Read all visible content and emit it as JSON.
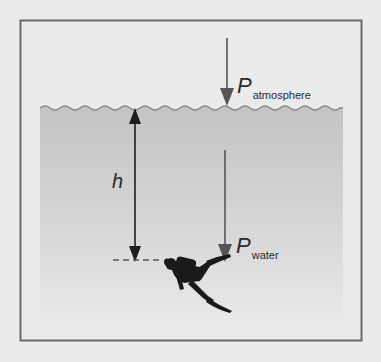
{
  "diagram": {
    "labels": {
      "atmosphere": {
        "main": "P",
        "sub": "atmosphere"
      },
      "water": {
        "main": "P",
        "sub": "water"
      },
      "depth": "h"
    },
    "elements": [
      {
        "id": "frame",
        "type": "rectangle",
        "description": "outer container"
      },
      {
        "id": "water-surface",
        "type": "wavy-line",
        "description": "water surface"
      },
      {
        "id": "water-body",
        "type": "gradient-fill",
        "description": "water, darker near surface"
      },
      {
        "id": "atmosphere-arrow",
        "type": "arrow",
        "direction": "down",
        "label": "P atmosphere"
      },
      {
        "id": "water-arrow",
        "type": "arrow",
        "direction": "down",
        "label": "P water"
      },
      {
        "id": "depth-arrow",
        "type": "double-arrow",
        "label": "h"
      },
      {
        "id": "depth-marker",
        "type": "dashed-line"
      },
      {
        "id": "diver",
        "type": "silhouette",
        "description": "scuba diver"
      }
    ],
    "colors": {
      "background": "#ebebeb",
      "frame": "#6a6a6a",
      "water_top": "#c4c4c4",
      "water_bottom": "#e6e6e6",
      "surface_line": "#8a8a8a",
      "pressure_arrow": "#555555",
      "depth_arrow": "#1e1e1e",
      "diver": "#1a1a1a"
    }
  }
}
